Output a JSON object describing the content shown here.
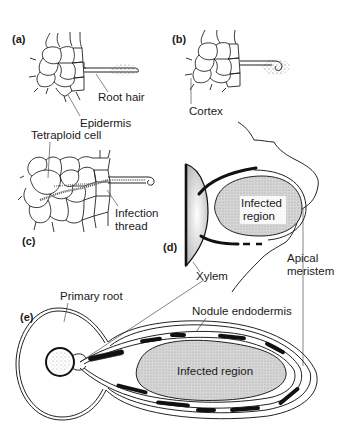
{
  "figure": {
    "colors": {
      "ink": "#1a1a1a",
      "infected_fill": "#d4d4d4",
      "background": "#ffffff"
    }
  },
  "panels": {
    "a": {
      "tag": "(a)",
      "labels": {
        "root_hair": "Root hair",
        "epidermis": "Epidermis"
      }
    },
    "b": {
      "tag": "(b)",
      "labels": {
        "cortex": "Cortex"
      }
    },
    "c": {
      "tag": "(c)",
      "labels": {
        "tetraploid_cell": "Tetraploid cell",
        "infection_thread_line1": "Infection",
        "infection_thread_line2": "thread"
      }
    },
    "d": {
      "tag": "(d)",
      "labels": {
        "infected_region_line1": "Infected",
        "infected_region_line2": "region",
        "xylem": "Xylem",
        "apical_meristem_line1": "Apical",
        "apical_meristem_line2": "meristem"
      }
    },
    "e": {
      "tag": "(e)",
      "labels": {
        "primary_root": "Primary root",
        "nodule_endodermis": "Nodule endodermis",
        "infected_region": "Infected region"
      }
    }
  }
}
